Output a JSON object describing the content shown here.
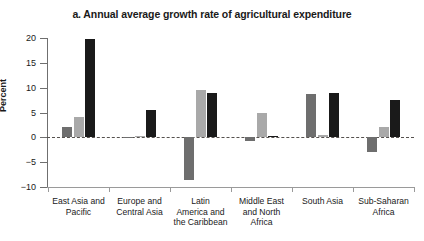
{
  "chart": {
    "title": "a. Annual average growth rate of agricultural expenditure",
    "ylabel": "Percent"
  },
  "chart_data": {
    "type": "bar",
    "title": "a. Annual average growth rate of agricultural expenditure",
    "xlabel": "",
    "ylabel": "Percent",
    "ylim": [
      -10,
      20
    ],
    "yticks": [
      20,
      15,
      10,
      5,
      0,
      -5,
      -10
    ],
    "ytick_labels": [
      "20",
      "15",
      "10",
      "5",
      "0",
      "−5",
      "−10"
    ],
    "grid": false,
    "legend": "none",
    "zero_line": true,
    "categories": [
      "East Asia and\nPacific",
      "Europe and\nCentral Asia",
      "Latin\nAmerica and\nthe Caribbean",
      "Middle East\nand North\nAfrica",
      "South Asia",
      "Sub-Saharan\nAfrica"
    ],
    "series": [
      {
        "name": "series-1",
        "color": "#6e6e6e",
        "values": [
          2.0,
          0.0,
          -8.5,
          -0.8,
          8.8,
          -3.0
        ]
      },
      {
        "name": "series-2",
        "color": "#a9a9a9",
        "values": [
          4.0,
          0.3,
          9.5,
          4.9,
          0.4,
          2.0
        ]
      },
      {
        "name": "series-3",
        "color": "#1a1a1a",
        "values": [
          19.8,
          5.5,
          9.0,
          0.2,
          9.0,
          7.5
        ]
      }
    ]
  }
}
